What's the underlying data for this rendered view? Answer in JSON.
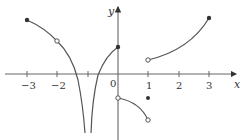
{
  "figure": {
    "type": "function-graph",
    "axes": {
      "x_label": "x",
      "y_label": "y",
      "x_ticks": [
        "−3",
        "−2",
        "0",
        "1",
        "2",
        "3"
      ],
      "x_tick_values": [
        -3,
        -2,
        -1,
        0,
        1,
        2,
        3
      ],
      "origin_label": "0"
    },
    "colors": {
      "curve": "#555555",
      "axis": "#555555",
      "text": "#333333"
    },
    "pieces": [
      {
        "name": "left-branch",
        "from": [
          -3,
          1.75
        ],
        "to": [
          -1,
          "-inf"
        ],
        "start_point": "filled",
        "passes_open_point": [
          -2,
          1.1
        ]
      },
      {
        "name": "asymptote-right-branch",
        "from": [
          -1,
          "-inf"
        ],
        "to": [
          0,
          0.9
        ],
        "end_point": "filled"
      },
      {
        "name": "middle-branch",
        "from": [
          0,
          -0.8
        ],
        "to": [
          1,
          -1.5
        ],
        "start_point": "open",
        "end_point": "open"
      },
      {
        "name": "isolated-point",
        "at": [
          1,
          -0.8
        ],
        "point": "filled"
      },
      {
        "name": "right-branch",
        "from": [
          1,
          0.45
        ],
        "to": [
          3,
          1.8
        ],
        "start_point": "open",
        "end_point": "filled"
      }
    ]
  }
}
